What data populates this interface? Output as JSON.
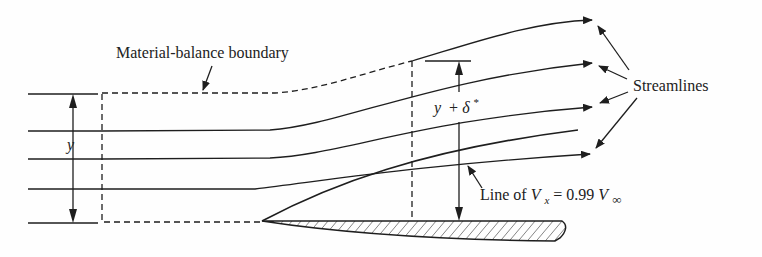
{
  "diagram": {
    "labels": {
      "boundary": "Material-balance boundary",
      "streamlines": "Streamlines",
      "y_left": "y",
      "y_delta_y": "y",
      "y_delta_plus": "+",
      "y_delta_delta": "δ",
      "y_delta_star": "*",
      "line_prefix": "Line of ",
      "line_V": "V",
      "line_sub_x": "x",
      "line_eq": " = 0.99 ",
      "line_V2": "V",
      "line_sub_inf": "∞"
    },
    "colors": {
      "stroke": "#1e1e1e",
      "background": "#fefefe"
    }
  }
}
